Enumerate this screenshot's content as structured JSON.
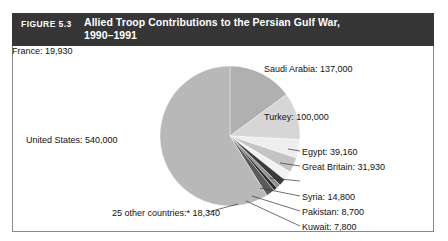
{
  "figure": {
    "number_label": "FIGURE 5.3",
    "title_line1": "Allied Troop Contributions to the Persian Gulf War,",
    "title_line2": "1990–1991",
    "header_bg": "#363636",
    "header_text_color": "#ffffff",
    "frame_border_color": "#8a8a8a",
    "background": "#ffffff"
  },
  "chart_data": {
    "type": "pie",
    "title": "Allied Troop Contributions to the Persian Gulf War, 1990–1991",
    "xlabel": "",
    "ylabel": "",
    "total": 917660,
    "units": "troops",
    "start_angle_deg": 0,
    "direction": "clockwise",
    "legend_position": "callout-labels",
    "grid": false,
    "categories": [
      "Saudi Arabia",
      "Turkey",
      "Egypt",
      "Great Britain",
      "France",
      "Syria",
      "Pakistan",
      "Kuwait",
      "25 other countries:*",
      "United States"
    ],
    "values": [
      137000,
      100000,
      39160,
      31930,
      19930,
      14800,
      8700,
      7800,
      18340,
      540000
    ],
    "labels": [
      "Saudi Arabia: 137,000",
      "Turkey: 100,000",
      "Egypt: 39,160",
      "Great Britain: 31,930",
      "France: 19,930",
      "Syria: 14,800",
      "Pakistan: 8,700",
      "Kuwait: 7,800",
      "25 other countries:* 18,340",
      "United States: 540,000"
    ],
    "slice_colors": [
      "#b0b0b0",
      "#d6d6d6",
      "#eeeeee",
      "#c4c4c4",
      "#f2f2f2",
      "#3a3a3a",
      "#8e8e8e",
      "#2b2b2b",
      "#5a5a5a",
      "#b8b8b8"
    ],
    "slice_percent": [
      14.93,
      10.9,
      4.27,
      3.48,
      2.17,
      1.61,
      0.95,
      0.85,
      2.0,
      58.84
    ]
  },
  "labels": {
    "saudi_arabia": "Saudi Arabia: 137,000",
    "turkey": "Turkey: 100,000",
    "egypt": "Egypt: 39,160",
    "great_britain": "Great Britain: 31,930",
    "france": "France: 19,930",
    "syria": "Syria: 14,800",
    "pakistan": "Pakistan: 8,700",
    "kuwait": "Kuwait: 7,800",
    "other_countries": "25 other countries:* 18,340",
    "united_states": "United States: 540,000"
  }
}
